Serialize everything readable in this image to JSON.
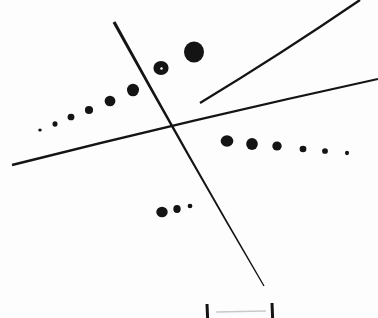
{
  "figure": {
    "title": "Hand-drawn dot-series and line figure",
    "background_color": "#ffffff",
    "ink_color": "#141414",
    "faint_mark_color": "#c9c9c9",
    "width": 378,
    "height": 318
  },
  "chart_data": {
    "type": "scatter",
    "title": "Hand-drawn dot-series and line figure",
    "subtitle": "",
    "xlabel": "",
    "ylabel": "",
    "grid": false,
    "legend": "none",
    "xlim": [
      0,
      378
    ],
    "ylim": [
      318,
      0
    ],
    "axis_note": "pixel coordinates, y increases downward",
    "series": [
      {
        "name": "upper-left-ascending-dots",
        "marker": "filled circle",
        "color": "#141414",
        "points": [
          {
            "x": 40,
            "y": 130,
            "d": 3.4
          },
          {
            "x": 55,
            "y": 124,
            "d": 5.2
          },
          {
            "x": 71,
            "y": 117,
            "d": 6.6
          },
          {
            "x": 89,
            "y": 110,
            "d": 8.4
          },
          {
            "x": 110,
            "y": 101,
            "d": 10.4
          },
          {
            "x": 133,
            "y": 90,
            "d": 12.4
          },
          {
            "x": 161,
            "y": 68,
            "d": 14.6
          },
          {
            "x": 194,
            "y": 52,
            "d": 20.6
          }
        ]
      },
      {
        "name": "right-descending-dots",
        "marker": "filled circle",
        "color": "#141414",
        "points": [
          {
            "x": 227,
            "y": 141,
            "d": 12.2
          },
          {
            "x": 252,
            "y": 144,
            "d": 12.0
          },
          {
            "x": 277,
            "y": 146,
            "d": 9.0
          },
          {
            "x": 303,
            "y": 149,
            "d": 7.0
          },
          {
            "x": 325,
            "y": 151,
            "d": 5.6
          },
          {
            "x": 347,
            "y": 153,
            "d": 4.2
          }
        ]
      },
      {
        "name": "lower-middle-dots",
        "marker": "filled circle",
        "color": "#141414",
        "points": [
          {
            "x": 162,
            "y": 212,
            "d": 11.0
          },
          {
            "x": 177,
            "y": 209,
            "d": 7.6
          },
          {
            "x": 190,
            "y": 206,
            "d": 4.6
          }
        ]
      }
    ],
    "lines": [
      {
        "name": "steep-descending-line",
        "from": {
          "x": 114,
          "y": 22
        },
        "to": {
          "x": 264,
          "y": 286
        },
        "stroke_width_start": 3.2,
        "stroke_width_end": 1.3
      },
      {
        "name": "long-shallow-rising-line",
        "from": {
          "x": 12,
          "y": 165
        },
        "to": {
          "x": 378,
          "y": 79
        },
        "stroke_width_start": 2.6,
        "stroke_width_end": 2.0
      },
      {
        "name": "upper-right-rising-line",
        "from": {
          "x": 200,
          "y": 103
        },
        "to": {
          "x": 360,
          "y": 0
        },
        "stroke_width_start": 2.2,
        "stroke_width_end": 2.4
      }
    ],
    "tick_marks": [
      {
        "name": "bottom-tick-left",
        "x": 207,
        "y_top": 304,
        "y_bottom": 318
      },
      {
        "name": "bottom-tick-right",
        "x": 272,
        "y_top": 303,
        "y_bottom": 318
      }
    ],
    "faint_marks": [
      {
        "name": "bottom-faint-rule",
        "x1": 216,
        "y1": 312,
        "x2": 266,
        "y2": 311
      }
    ]
  }
}
